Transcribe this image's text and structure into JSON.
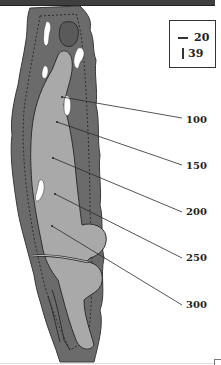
{
  "hole_map": {
    "legend": {
      "rows": [
        {
          "symbol": "horizontal-line",
          "value": "20"
        },
        {
          "symbol": "vertical-line",
          "value": "39"
        }
      ]
    },
    "distance_markers": [
      {
        "label": "100",
        "x": 186,
        "y": 120
      },
      {
        "label": "150",
        "x": 186,
        "y": 166
      },
      {
        "label": "200",
        "x": 186,
        "y": 212
      },
      {
        "label": "250",
        "x": 186,
        "y": 258
      },
      {
        "label": "300",
        "x": 186,
        "y": 305
      }
    ],
    "colors": {
      "rough": "#6b6b6b",
      "fairway": "#a9a9a9",
      "green": "#5a5a5a",
      "bunker": "#ffffff",
      "outline": "#2e2e2e",
      "topbar": "#3f3f3f"
    }
  }
}
